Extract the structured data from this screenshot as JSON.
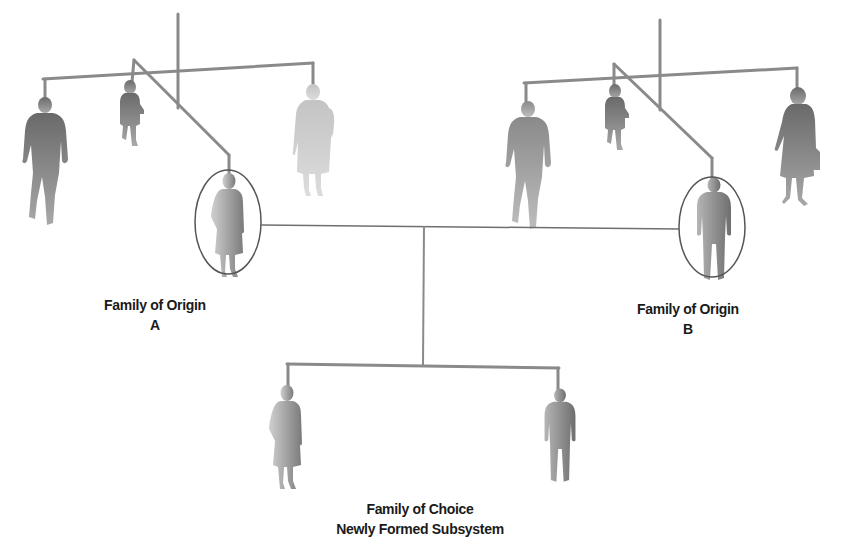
{
  "diagram": {
    "colors": {
      "rod": "#8a8a8a",
      "ellipse": "#555555",
      "connector": "#6f6f6f",
      "figure_dark": "#6a6a6a",
      "figure_light": "#c8c8c8",
      "text": "#1a1a1a"
    },
    "mobiles": [
      {
        "id": "origin-a",
        "figures": [
          "man-walking",
          "child",
          "woman-circled",
          "woman-with-child"
        ],
        "circled": "woman"
      },
      {
        "id": "origin-b",
        "figures": [
          "man-walking",
          "child",
          "man-circled",
          "woman-with-briefcase"
        ],
        "circled": "man"
      },
      {
        "id": "choice",
        "figures": [
          "woman",
          "man"
        ]
      }
    ]
  },
  "labels": {
    "origin_a": {
      "line1": "Family of Origin",
      "line2": "A"
    },
    "origin_b": {
      "line1": "Family of Origin",
      "line2": "B"
    },
    "choice": {
      "line1": "Family of Choice",
      "line2": "Newly Formed Subsystem"
    }
  }
}
